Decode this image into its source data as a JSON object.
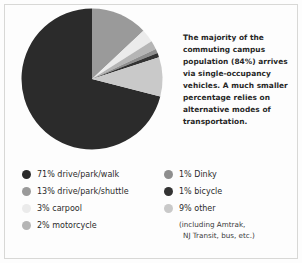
{
  "chart_data": {
    "type": "pie",
    "title": "",
    "categories": [
      "71% drive/park/walk",
      "13% drive/park/shuttle",
      "3% carpool",
      "2% motorcycle",
      "1% Dinky",
      "1% bicycle",
      "9% other"
    ],
    "values": [
      71,
      13,
      3,
      2,
      1,
      1,
      9
    ],
    "colors": [
      "#2b2b2b",
      "#9a9a9a",
      "#ebebeb",
      "#b5b5b5",
      "#8e8e8e",
      "#333333",
      "#c9c9c9"
    ],
    "legend_position": "bottom",
    "grid": false,
    "start_angle_deg": 0,
    "direction": "clockwise",
    "annotation": "The majority of the commuting campus population (84%) arrives via single-occupancy vehicles. A much smaller percentage relies on alternative modes of transportation."
  },
  "blurb": {
    "text": "The majority of the commuting campus population (84%) arrives via single-occupancy vehicles. A much smaller percentage relies on alternative modes of transportation."
  },
  "legend": {
    "left": [
      {
        "label": "71% drive/park/walk",
        "color": "#2b2b2b"
      },
      {
        "label": "13% drive/park/shuttle",
        "color": "#9a9a9a"
      },
      {
        "label": "3% carpool",
        "color": "#ebebeb"
      },
      {
        "label": "2% motorcycle",
        "color": "#b5b5b5"
      }
    ],
    "right": [
      {
        "label": "1% Dinky",
        "color": "#8e8e8e"
      },
      {
        "label": "1% bicycle",
        "color": "#333333"
      },
      {
        "label": "9% other",
        "color": "#c9c9c9"
      }
    ],
    "other_note_line1": "(including Amtrak,",
    "other_note_line2": "NJ Transit, bus, etc.)"
  }
}
